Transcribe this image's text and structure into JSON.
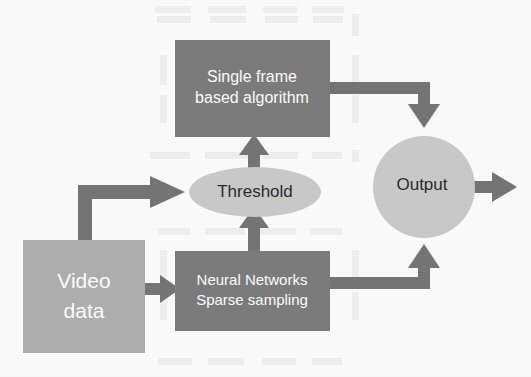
{
  "diagram": {
    "type": "flow-diagram",
    "background_color": "#fdfdfd",
    "colors": {
      "dark_block": "#7d7d7d",
      "mid_block": "#b0b0b0",
      "light_shape": "#cbcbcb",
      "arrow": "#767676",
      "text_light": "#ffffff",
      "text_dark": "#2b2b2b",
      "watermark": "#e9e9e9"
    },
    "nodes": {
      "single_frame": {
        "id": "single-frame-based-algorithm",
        "shape": "rectangle",
        "fill": "#7d7d7d",
        "text_color": "#ffffff",
        "line1": "Single frame",
        "line2": "based algorithm",
        "x": 175,
        "y": 40,
        "width": 155,
        "height": 97,
        "font_size": 16
      },
      "threshold": {
        "id": "threshold",
        "shape": "ellipse",
        "fill": "#cbcbcb",
        "text_color": "#2b2b2b",
        "line1": "Threshold",
        "cx": 255,
        "cy": 192,
        "rx": 66,
        "ry": 25,
        "font_size": 17
      },
      "video_data": {
        "id": "video-data",
        "shape": "rectangle",
        "fill": "#b0b0b0",
        "text_color": "#ffffff",
        "line1": "Video",
        "line2": "data",
        "x": 23,
        "y": 240,
        "width": 122,
        "height": 113,
        "font_size": 21
      },
      "neural_networks": {
        "id": "neural-networks-sparse-sampling",
        "shape": "rectangle",
        "fill": "#7d7d7d",
        "text_color": "#ffffff",
        "line1": "Neural Networks",
        "line2": "Sparse sampling",
        "x": 175,
        "y": 251,
        "width": 155,
        "height": 80,
        "font_size": 15
      },
      "output": {
        "id": "output",
        "shape": "circle",
        "fill": "#cbcbcb",
        "text_color": "#2b2b2b",
        "line1": "Output",
        "cx": 424,
        "cy": 187,
        "r": 51,
        "font_size": 17
      }
    },
    "edges": [
      {
        "id": "video-data-to-threshold",
        "from": "video_data",
        "to": "threshold",
        "style": "elbow-up-right",
        "label": ""
      },
      {
        "id": "video-data-to-neural-networks",
        "from": "video_data",
        "to": "neural_networks",
        "style": "straight-right",
        "label": ""
      },
      {
        "id": "neural-networks-to-threshold",
        "from": "neural_networks",
        "to": "threshold",
        "style": "straight-up",
        "label": ""
      },
      {
        "id": "threshold-to-single-frame",
        "from": "threshold",
        "to": "single_frame",
        "style": "straight-up",
        "label": ""
      },
      {
        "id": "single-frame-to-output",
        "from": "single_frame",
        "to": "output",
        "style": "elbow-right-down",
        "label": ""
      },
      {
        "id": "neural-networks-to-output",
        "from": "neural_networks",
        "to": "output",
        "style": "elbow-right-up",
        "label": ""
      },
      {
        "id": "output-to-exit",
        "from": "output",
        "to": "",
        "style": "straight-right",
        "label": ""
      }
    ],
    "watermark": {
      "visible": true,
      "note": "faint illegible scanned background text",
      "rows": [
        {
          "y": 18,
          "cells": [
            "",
            "",
            "",
            ""
          ]
        },
        {
          "y": 148,
          "cells": [
            "",
            "",
            "",
            ""
          ]
        },
        {
          "y": 228,
          "cells": [
            "",
            "",
            "",
            ""
          ]
        },
        {
          "y": 360,
          "cells": [
            "",
            "",
            "",
            ""
          ]
        }
      ]
    }
  }
}
